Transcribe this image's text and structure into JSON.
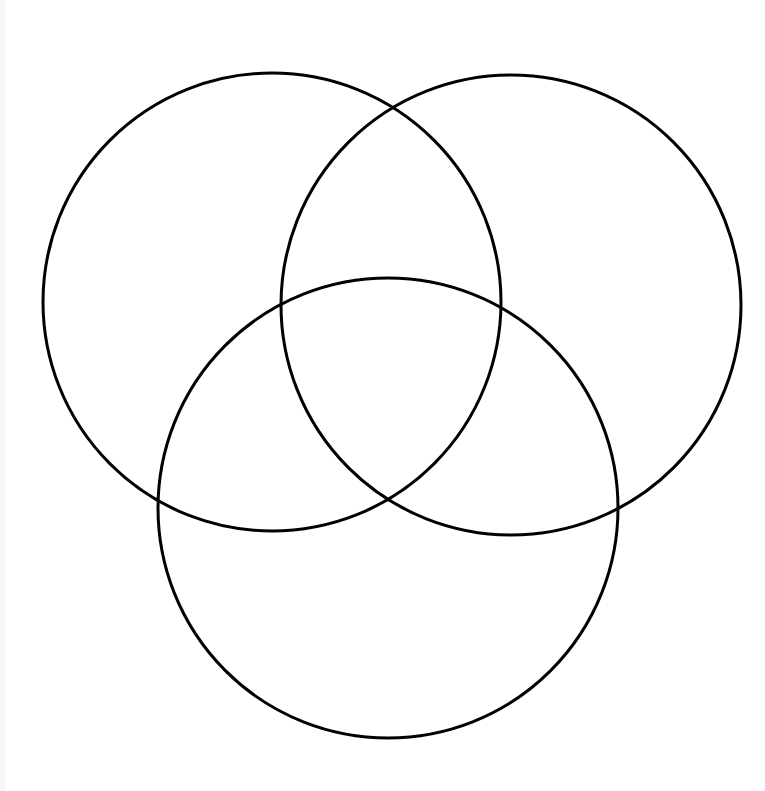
{
  "diagram": {
    "type": "venn",
    "set_count": 3,
    "stroke_color": "#000000",
    "fill_color": "none",
    "background": "#ffffff",
    "stroke_width": 3,
    "circles": [
      {
        "id": "circle-top-left",
        "cx": 272,
        "cy": 302,
        "r": 229
      },
      {
        "id": "circle-top-right",
        "cx": 511,
        "cy": 305,
        "r": 230
      },
      {
        "id": "circle-bottom",
        "cx": 388,
        "cy": 508,
        "r": 230
      }
    ],
    "labels": []
  }
}
